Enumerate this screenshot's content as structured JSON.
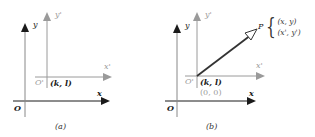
{
  "panels": [
    {
      "id": "a",
      "caption": "(a)",
      "labels": {
        "y": "y",
        "y_prime": "y'",
        "x": "x",
        "x_prime": "x'",
        "origin": "O",
        "origin_prime": "O'",
        "origin_prime_coords": "(k, l)"
      }
    },
    {
      "id": "b",
      "caption": "(b)",
      "labels": {
        "y": "y",
        "y_prime": "y'",
        "x": "x",
        "x_prime": "x'",
        "origin": "O",
        "origin_prime": "O'",
        "origin_prime_coords": "(k, l)",
        "origin_prime_coords_new": "(0, 0)",
        "point": "P",
        "point_coords": [
          "(x, y)",
          "(x', y')"
        ]
      }
    }
  ],
  "colors": {
    "original_axes": "#1a1a1a",
    "translated_axes": "#9a9a9a",
    "vector": "#333333"
  }
}
